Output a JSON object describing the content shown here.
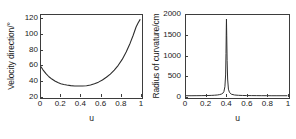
{
  "figure": {
    "background": "#ffffff",
    "axis_color": "#3d3d3d",
    "line_color": "#2b2b2b",
    "text_color": "#1a1a1a"
  },
  "chart_data": [
    {
      "type": "line",
      "title": "",
      "xlabel": "u",
      "ylabel": "Velocity direction/°",
      "xlim": [
        0,
        1
      ],
      "ylim": [
        20,
        125
      ],
      "grid": false,
      "legend": null,
      "xticks": [
        "0",
        "0.2",
        "0.4",
        "0.6",
        "0.8",
        "1"
      ],
      "xtick_values": [
        0,
        0.2,
        0.4,
        0.6,
        0.8,
        1
      ],
      "yticks": [
        "20",
        "40",
        "60",
        "80",
        "100",
        "120"
      ],
      "ytick_values": [
        20,
        40,
        60,
        80,
        100,
        120
      ],
      "x": [
        0,
        0.02,
        0.05,
        0.08,
        0.11,
        0.14,
        0.17,
        0.2,
        0.23,
        0.26,
        0.3,
        0.34,
        0.38,
        0.42,
        0.46,
        0.5,
        0.54,
        0.58,
        0.62,
        0.66,
        0.7,
        0.74,
        0.78,
        0.82,
        0.86,
        0.9,
        0.93,
        0.96,
        0.98,
        1
      ],
      "values": [
        58.0,
        54.0,
        49.0,
        45.0,
        42.0,
        39.5,
        37.5,
        36.0,
        35.0,
        34.2,
        33.5,
        33.1,
        33.0,
        33.0,
        33.4,
        34.3,
        35.8,
        38.0,
        40.8,
        44.3,
        48.5,
        53.6,
        59.8,
        67.5,
        77.0,
        88.5,
        98.5,
        109.5,
        114.5,
        119.0
      ]
    },
    {
      "type": "line",
      "title": "",
      "xlabel": "u",
      "ylabel": "Radius of curvature/cm",
      "xlim": [
        0,
        1
      ],
      "ylim": [
        0,
        2000
      ],
      "grid": false,
      "legend": null,
      "xticks": [
        "0",
        "0.2",
        "0.4",
        "0.6",
        "0.8",
        "1"
      ],
      "xtick_values": [
        0,
        0.2,
        0.4,
        0.6,
        0.8,
        1
      ],
      "yticks": [
        "0",
        "500",
        "1000",
        "1500",
        "2000"
      ],
      "ytick_values": [
        0,
        500,
        1000,
        1500,
        2000
      ],
      "peak": {
        "x": 0.4,
        "y": 1900
      },
      "x": [
        0,
        0.05,
        0.1,
        0.15,
        0.2,
        0.25,
        0.28,
        0.31,
        0.33,
        0.35,
        0.365,
        0.375,
        0.385,
        0.392,
        0.396,
        0.399,
        0.4005,
        0.403,
        0.407,
        0.412,
        0.42,
        0.43,
        0.45,
        0.48,
        0.52,
        0.56,
        0.6,
        0.65,
        0.7,
        0.75,
        0.8,
        0.85,
        0.9,
        0.95,
        1
      ],
      "values": [
        8,
        8,
        9,
        10,
        12,
        16,
        20,
        26,
        34,
        48,
        70,
        110,
        230,
        520,
        1050,
        1700,
        1900,
        1500,
        880,
        420,
        170,
        90,
        45,
        26,
        18,
        14,
        12,
        11,
        10,
        9,
        9,
        8,
        8,
        8,
        8
      ]
    }
  ]
}
